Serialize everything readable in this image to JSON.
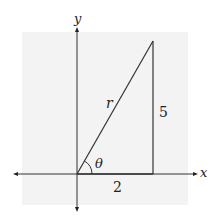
{
  "diagram": {
    "type": "right-triangle-on-coordinate-axes",
    "axes": {
      "x_label": "x",
      "y_label": "y"
    },
    "triangle": {
      "hypotenuse_label": "r",
      "opposite_side_label": "5",
      "adjacent_side_label": "2",
      "angle_label": "θ"
    },
    "colors": {
      "background_panel": "#f3f3f3",
      "stroke": "#333333"
    }
  }
}
